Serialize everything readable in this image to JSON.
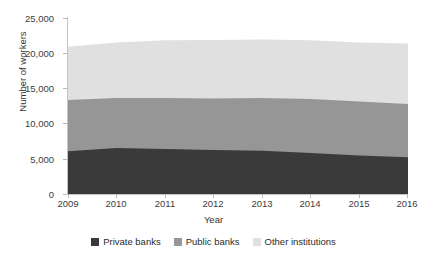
{
  "chart_data": {
    "type": "area",
    "stacked": true,
    "title": "",
    "xlabel": "Year",
    "ylabel": "Number of workers",
    "x": [
      2009,
      2010,
      2011,
      2012,
      2013,
      2014,
      2015,
      2016
    ],
    "categories": [
      "2009",
      "2010",
      "2011",
      "2012",
      "2013",
      "2014",
      "2015",
      "2016"
    ],
    "ylim": [
      0,
      25000
    ],
    "yticks": [
      0,
      5000,
      10000,
      15000,
      20000,
      25000
    ],
    "ytick_labels": [
      "0",
      "5,000",
      "10,000",
      "15,000",
      "20,000",
      "25,000"
    ],
    "grid": false,
    "legend_position": "bottom",
    "series": [
      {
        "name": "Private banks",
        "color": "#3a3a3a",
        "values": [
          5950,
          6400,
          6250,
          6100,
          6000,
          5700,
          5350,
          5100
        ],
        "cumulative_top": [
          5950,
          6400,
          6250,
          6100,
          6000,
          5700,
          5350,
          5100
        ]
      },
      {
        "name": "Public banks",
        "color": "#969696",
        "values": [
          7100,
          6950,
          7100,
          7150,
          7350,
          7500,
          7500,
          7400
        ],
        "cumulative_top": [
          13050,
          13350,
          13350,
          13250,
          13350,
          13200,
          12850,
          12500
        ]
      },
      {
        "name": "Other institutions",
        "color": "#e0e0e0",
        "values": [
          7400,
          7700,
          8000,
          8150,
          8100,
          8150,
          8200,
          8400
        ],
        "cumulative_top": [
          20450,
          21050,
          21350,
          21400,
          21450,
          21350,
          21050,
          20900
        ]
      }
    ]
  },
  "axes": {
    "y_title": "Number of workers",
    "x_title": "Year",
    "y_labels": [
      "25,000",
      "20,000",
      "15,000",
      "10,000",
      "5,000",
      "0"
    ],
    "x_labels": [
      "2009",
      "2010",
      "2011",
      "2012",
      "2013",
      "2014",
      "2015",
      "2016"
    ]
  },
  "legend": {
    "entries": [
      {
        "label": "Private banks",
        "color": "#3a3a3a"
      },
      {
        "label": "Public banks",
        "color": "#969696"
      },
      {
        "label": "Other institutions",
        "color": "#e0e0e0"
      }
    ]
  },
  "title_clipped": ""
}
